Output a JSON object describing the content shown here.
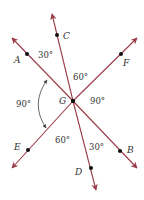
{
  "diagram": {
    "center": {
      "label": "G",
      "x": 73,
      "y": 101
    },
    "colors": {
      "ray": "#9b3a47",
      "point": "#111111",
      "text": "#333333",
      "arc": "#444444"
    },
    "rays": [
      {
        "name": "ray-GA",
        "tip": [
          12,
          38
        ],
        "point": {
          "label": "A",
          "x": 27,
          "y": 54
        },
        "label_pos": [
          14,
          63
        ]
      },
      {
        "name": "ray-GC",
        "tip": [
          52,
          14
        ],
        "point": {
          "label": "C",
          "x": 57,
          "y": 35
        },
        "label_pos": [
          63,
          39
        ]
      },
      {
        "name": "ray-GF",
        "tip": [
          137,
          38
        ],
        "point": {
          "label": "F",
          "x": 121,
          "y": 54
        },
        "label_pos": [
          123,
          66
        ]
      },
      {
        "name": "ray-GE",
        "tip": [
          12,
          168
        ],
        "point": {
          "label": "E",
          "x": 28,
          "y": 150
        },
        "label_pos": [
          14,
          150
        ]
      },
      {
        "name": "ray-GD",
        "tip": [
          96,
          190
        ],
        "point": {
          "label": "D",
          "x": 91,
          "y": 168
        },
        "label_pos": [
          75,
          175
        ]
      },
      {
        "name": "ray-GB",
        "tip": [
          137,
          168
        ],
        "point": {
          "label": "B",
          "x": 120,
          "y": 151
        },
        "label_pos": [
          127,
          153
        ]
      }
    ],
    "angles": [
      {
        "name": "angle-AGC",
        "text": "30°",
        "x": 38,
        "y": 58
      },
      {
        "name": "angle-CGF",
        "text": "60°",
        "x": 73,
        "y": 80
      },
      {
        "name": "angle-FGB",
        "text": "90°",
        "x": 90,
        "y": 104
      },
      {
        "name": "angle-AGE",
        "text": "90°",
        "x": 16,
        "y": 107
      },
      {
        "name": "angle-EGD",
        "text": "60°",
        "x": 55,
        "y": 143
      },
      {
        "name": "angle-DGB",
        "text": "30°",
        "x": 89,
        "y": 150
      }
    ],
    "arc_arrow": {
      "from": [
        47,
        80
      ],
      "to": [
        46,
        128
      ],
      "control": [
        30,
        104
      ]
    }
  }
}
